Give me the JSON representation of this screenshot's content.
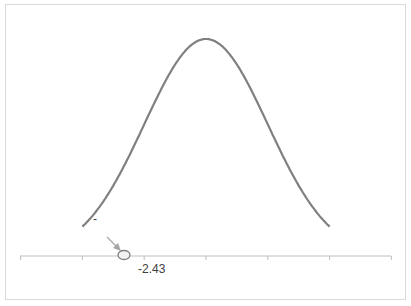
{
  "chart_data": {
    "type": "line",
    "title": "",
    "xlabel": "",
    "ylabel": "",
    "xlim": [
      -3,
      3
    ],
    "x_ticks": [
      -3,
      -2,
      -1,
      0,
      1,
      2,
      3
    ],
    "x_tick_labels_visible": [],
    "grid": false,
    "legend": null,
    "series": [
      {
        "name": "normal pdf",
        "mean": 0,
        "sd": 1,
        "color": "#808080"
      }
    ],
    "shaded_region": {
      "from": -3,
      "to": -2.43,
      "color": "#6e6e6e"
    },
    "annotations": [
      {
        "text": "-2.43",
        "x": -2.43,
        "position": "below axis"
      },
      {
        "text": "-",
        "type": "arrow label pointing to shaded tail"
      }
    ]
  },
  "labels": {
    "critical_value": "-2.43",
    "arrow_label": "-"
  },
  "colors": {
    "curve": "#808080",
    "axis": "#bfbfbf",
    "shade": "#6e6e6e",
    "arrow": "#a6a6a6",
    "border": "#d9d9d9"
  }
}
